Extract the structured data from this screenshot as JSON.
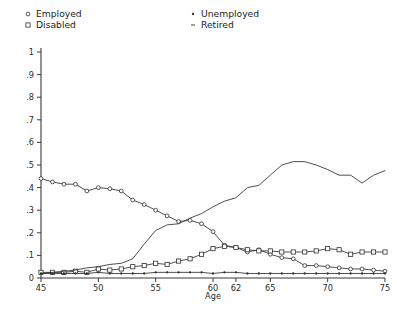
{
  "legend": {
    "entries": [
      {
        "label": "Employed",
        "marker": "circle-marker-icon",
        "col": 0,
        "row": 0
      },
      {
        "label": "Disabled",
        "marker": "square-marker-icon",
        "col": 0,
        "row": 1
      },
      {
        "label": "Unemployed",
        "marker": "dot-marker-icon",
        "col": 1,
        "row": 0
      },
      {
        "label": "Retired",
        "marker": "line-marker-icon",
        "col": 1,
        "row": 1
      }
    ]
  },
  "chart_data": {
    "type": "line",
    "title": "",
    "subtitle": "",
    "xlabel": "Age",
    "ylabel": "",
    "xlim": [
      45,
      75
    ],
    "ylim": [
      0,
      1
    ],
    "grid": false,
    "legend_position": "top",
    "xticks": [
      45,
      50,
      55,
      60,
      62,
      65,
      70,
      75
    ],
    "xticklabels": [
      "45",
      "50",
      "55",
      "60",
      "62",
      "65",
      "70",
      "75"
    ],
    "yticks": [
      0,
      0.1,
      0.2,
      0.3,
      0.4,
      0.5,
      0.6,
      0.7,
      0.8,
      0.9,
      1
    ],
    "yticklabels": [
      "0",
      ".1",
      ".2",
      ".3",
      ".4",
      ".5",
      ".6",
      ".7",
      ".8",
      ".9",
      "1"
    ],
    "x": [
      45,
      46,
      47,
      48,
      49,
      50,
      51,
      52,
      53,
      54,
      55,
      56,
      57,
      58,
      59,
      60,
      61,
      62,
      63,
      64,
      65,
      66,
      67,
      68,
      69,
      70,
      71,
      72,
      73,
      74,
      75
    ],
    "series": [
      {
        "name": "Employed",
        "marker": "circle",
        "values": [
          0.44,
          0.425,
          0.415,
          0.415,
          0.385,
          0.4,
          0.395,
          0.385,
          0.345,
          0.325,
          0.3,
          0.275,
          0.25,
          0.255,
          0.24,
          0.205,
          0.145,
          0.135,
          0.115,
          0.125,
          0.105,
          0.09,
          0.085,
          0.055,
          0.055,
          0.05,
          0.045,
          0.04,
          0.04,
          0.035,
          0.03
        ]
      },
      {
        "name": "Disabled",
        "marker": "square",
        "values": [
          0.025,
          0.025,
          0.025,
          0.03,
          0.025,
          0.04,
          0.035,
          0.04,
          0.05,
          0.055,
          0.065,
          0.06,
          0.075,
          0.085,
          0.105,
          0.13,
          0.14,
          0.135,
          0.125,
          0.12,
          0.12,
          0.115,
          0.115,
          0.115,
          0.12,
          0.13,
          0.125,
          0.105,
          0.115,
          0.115,
          0.115
        ]
      },
      {
        "name": "Unemployed",
        "marker": "dot",
        "values": [
          0.02,
          0.02,
          0.02,
          0.02,
          0.02,
          0.025,
          0.02,
          0.02,
          0.02,
          0.02,
          0.025,
          0.025,
          0.025,
          0.025,
          0.025,
          0.02,
          0.025,
          0.025,
          0.02,
          0.02,
          0.02,
          0.02,
          0.02,
          0.02,
          0.02,
          0.02,
          0.02,
          0.02,
          0.02,
          0.02,
          0.02
        ]
      },
      {
        "name": "Retired",
        "marker": "none",
        "values": [
          0.02,
          0.025,
          0.03,
          0.035,
          0.045,
          0.05,
          0.06,
          0.065,
          0.085,
          0.15,
          0.21,
          0.235,
          0.24,
          0.265,
          0.285,
          0.315,
          0.34,
          0.355,
          0.4,
          0.41,
          0.455,
          0.5,
          0.515,
          0.515,
          0.5,
          0.48,
          0.455,
          0.455,
          0.42,
          0.455,
          0.475
        ]
      }
    ]
  }
}
